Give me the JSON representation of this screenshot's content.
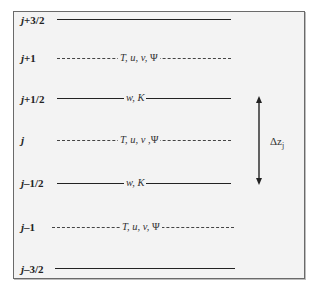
{
  "diagram": {
    "levels": [
      {
        "id": "j+3/2",
        "prefix": "j",
        "suffix": "+3/2",
        "type": "interface",
        "line": "solid",
        "variables": ""
      },
      {
        "id": "j+1",
        "prefix": "j",
        "suffix": "+1",
        "type": "center",
        "line": "dashed",
        "variables_pre": "T, u, v, ",
        "psi": "Ψ"
      },
      {
        "id": "j+1/2",
        "prefix": "j",
        "suffix": "+1/2",
        "type": "interface",
        "line": "solid",
        "variables": "w, K"
      },
      {
        "id": "j",
        "prefix": "j",
        "suffix": "",
        "type": "center",
        "line": "dashed",
        "variables_pre": "T, u, v ,",
        "psi": "Ψ"
      },
      {
        "id": "j-1/2",
        "prefix": "j",
        "suffix": "–1/2",
        "type": "interface",
        "line": "solid",
        "variables": "w, K"
      },
      {
        "id": "j-1",
        "prefix": "j",
        "suffix": "–1",
        "type": "center",
        "line": "dashed",
        "variables_pre": "T, u, v, ",
        "psi": "Ψ"
      },
      {
        "id": "j-3/2",
        "prefix": "j",
        "suffix": "–3/2",
        "type": "interface",
        "line": "solid",
        "variables": ""
      }
    ],
    "dimension": {
      "symbol": "Δz",
      "subscript": "j",
      "from_level": "j+1/2",
      "to_level": "j-1/2"
    },
    "colors": {
      "background": "#f3f3f3",
      "border": "#6a6a6a",
      "line": "#222222",
      "text": "#222222"
    }
  }
}
